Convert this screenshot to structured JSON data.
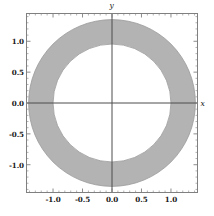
{
  "chart_data": {
    "type": "area",
    "title": "",
    "subtitle": "",
    "xlabel": "x",
    "ylabel": "y",
    "xlim": [
      -1.45,
      1.45
    ],
    "ylim": [
      -1.45,
      1.45
    ],
    "grid": false,
    "legend": null,
    "frame": true,
    "shape": "annulus",
    "annulus": {
      "center": [
        0,
        0
      ],
      "inner_radius": 1.0,
      "outer_radius": 1.414,
      "fill_color": "#b3b3b3",
      "edge_color": "#999999"
    },
    "xticks": [
      -1.0,
      -0.5,
      0.0,
      0.5,
      1.0
    ],
    "xtick_labels": [
      "-1.0",
      "-0.5",
      "0.0",
      "0.5",
      "1.0"
    ],
    "yticks": [
      -1.0,
      -0.5,
      0.0,
      0.5,
      1.0
    ],
    "ytick_labels": [
      "-1.0",
      "-0.5",
      "0.0",
      "0.5",
      "1.0"
    ],
    "minor_tick_step": 0.1,
    "axes_through_origin": true,
    "axis_color": "#4d4d4d",
    "frame_color": "#808080",
    "background_color": "#ffffff"
  },
  "axis_names": {
    "x": "x",
    "y": "y"
  }
}
